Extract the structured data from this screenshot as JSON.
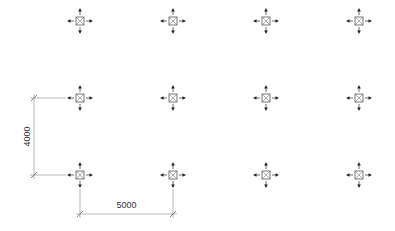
{
  "diagram": {
    "type": "column-grid-plan",
    "background": "#ffffff",
    "line_color": "#555555",
    "dim_line_color": "#888888",
    "columns_x": [
      80,
      173,
      266,
      359
    ],
    "rows_y": [
      21,
      98,
      175
    ],
    "symbol": {
      "name": "column-symbol",
      "description": "square with X and four outward arrows"
    },
    "dimensions": [
      {
        "name": "vertical-dimension",
        "label": "4000",
        "orientation": "vertical"
      },
      {
        "name": "horizontal-dimension",
        "label": "5000",
        "orientation": "horizontal"
      }
    ]
  }
}
